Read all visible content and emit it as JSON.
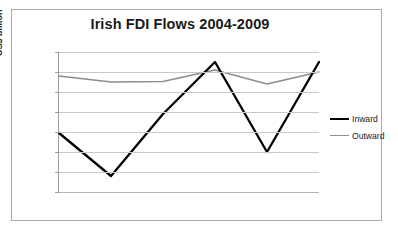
{
  "chart_data": {
    "type": "line",
    "title": "Irish FDI Flows 2004-2009",
    "xlabel": "",
    "ylabel": "US$ billion",
    "categories": [
      "2004",
      "2005",
      "2006",
      "2007",
      "2008",
      "2009"
    ],
    "series": [
      {
        "name": "Inward",
        "color": "#000000",
        "values": [
          -10.5,
          -32,
          -1,
          25,
          -20,
          25
        ]
      },
      {
        "name": "Outward",
        "color": "#8c8c8c",
        "values": [
          18,
          15,
          15.3,
          21,
          14,
          20
        ]
      }
    ],
    "ylim": [
      -40,
      30
    ],
    "yticks": [
      30,
      20,
      10,
      0,
      -10,
      -20,
      -30,
      -40
    ],
    "ytick_labels": [
      "30",
      "20",
      "10",
      "0",
      "-10",
      "-20",
      "-30",
      "-40"
    ],
    "grid": true,
    "legend_position": "right",
    "border_color": "#a9a9a9",
    "gridline_color": "#c8c8c8",
    "background": "#ffffff"
  },
  "legend": {
    "entries": [
      {
        "label": "Inward"
      },
      {
        "label": "Outward"
      }
    ]
  }
}
